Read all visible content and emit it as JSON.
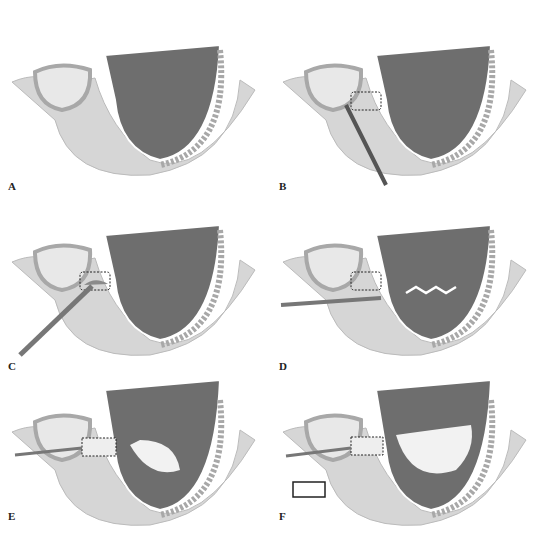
{
  "figure": {
    "panels": [
      {
        "id": "A",
        "label": "A",
        "state": "intact"
      },
      {
        "id": "B",
        "label": "B",
        "state": "window-outline"
      },
      {
        "id": "C",
        "label": "C",
        "state": "window-osteotomy"
      },
      {
        "id": "D",
        "label": "D",
        "state": "membrane-elevation"
      },
      {
        "id": "E",
        "label": "E",
        "state": "graft-placement"
      },
      {
        "id": "F",
        "label": "F",
        "state": "graft-complete"
      }
    ],
    "colors": {
      "sinus": "#6e6e6e",
      "bone": "#d6d6d6",
      "cortex": "#a8a8a8",
      "tooth": "#e8e8e8",
      "graft": "#f2f2f2",
      "outline": "#ffffff"
    }
  }
}
